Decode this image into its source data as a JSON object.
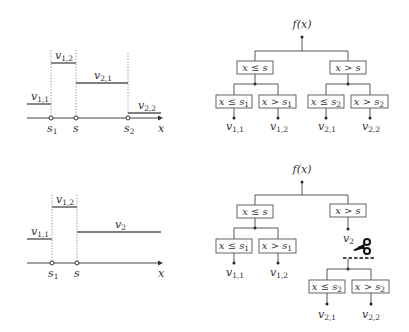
{
  "top_panel": {
    "step_plot": {
      "axis_label": "x",
      "ticks": [
        {
          "name": "s",
          "sub": "1"
        },
        {
          "name": "s",
          "sub": ""
        },
        {
          "name": "s",
          "sub": "2"
        }
      ],
      "segments": [
        {
          "name": "v",
          "sub": "1,1"
        },
        {
          "name": "v",
          "sub": "1,2"
        },
        {
          "name": "v",
          "sub": "2,1"
        },
        {
          "name": "v",
          "sub": "2,2"
        }
      ]
    },
    "tree": {
      "root": "f(x)",
      "level1": [
        {
          "label": "x ≤ s"
        },
        {
          "label": "x > s"
        }
      ],
      "level2": [
        {
          "pre": "x ≤ s",
          "sub": "1"
        },
        {
          "pre": "x > s",
          "sub": "1"
        },
        {
          "pre": "x ≤ s",
          "sub": "2"
        },
        {
          "pre": "x > s",
          "sub": "2"
        }
      ],
      "leaves": [
        {
          "name": "v",
          "sub": "1,1"
        },
        {
          "name": "v",
          "sub": "1,2"
        },
        {
          "name": "v",
          "sub": "2,1"
        },
        {
          "name": "v",
          "sub": "2,2"
        }
      ]
    }
  },
  "bottom_panel": {
    "step_plot": {
      "axis_label": "x",
      "ticks": [
        {
          "name": "s",
          "sub": "1"
        },
        {
          "name": "s",
          "sub": ""
        }
      ],
      "segments": [
        {
          "name": "v",
          "sub": "1,1"
        },
        {
          "name": "v",
          "sub": "1,2"
        },
        {
          "name": "v",
          "sub": ""
        }
      ],
      "v2_label": {
        "name": "v",
        "sub": "2"
      }
    },
    "tree": {
      "root": "f(x)",
      "level1": [
        {
          "label": "x ≤ s"
        },
        {
          "label": "x > s"
        }
      ],
      "level2": [
        {
          "pre": "x ≤ s",
          "sub": "1"
        },
        {
          "pre": "x > s",
          "sub": "1"
        }
      ],
      "pruned_node": {
        "name": "v",
        "sub": "2"
      },
      "prune_icon": "scissors-icon",
      "pruned_subtree": [
        {
          "pre": "x ≤ s",
          "sub": "2"
        },
        {
          "pre": "x > s",
          "sub": "2"
        }
      ],
      "leaves": [
        {
          "name": "v",
          "sub": "1,1"
        },
        {
          "name": "v",
          "sub": "1,2"
        },
        {
          "name": "v",
          "sub": "2,1"
        },
        {
          "name": "v",
          "sub": "2,2"
        }
      ]
    }
  }
}
